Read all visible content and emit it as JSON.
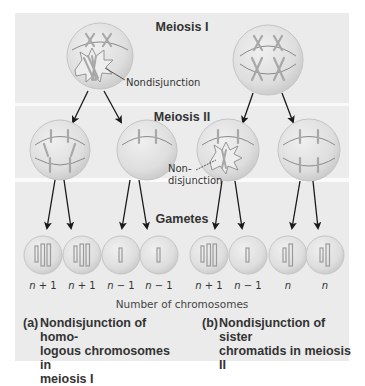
{
  "diagram": {
    "stages": {
      "meiosis_1": "Meiosis I",
      "meiosis_2": "Meiosis II",
      "gametes": "Gametes"
    },
    "callouts": {
      "nondisjunction_a": "Nondisjunction",
      "nondisjunction_b_line1": "Non-",
      "nondisjunction_b_line2": "disjunction"
    },
    "gamete_counts": [
      {
        "n": "n",
        "op": "+ 1",
        "panel": "a"
      },
      {
        "n": "n",
        "op": "+ 1",
        "panel": "a"
      },
      {
        "n": "n",
        "op": "− 1",
        "panel": "a"
      },
      {
        "n": "n",
        "op": "− 1",
        "panel": "a"
      },
      {
        "n": "n",
        "op": "+ 1",
        "panel": "b"
      },
      {
        "n": "n",
        "op": "− 1",
        "panel": "b"
      },
      {
        "n": "n",
        "op": "",
        "panel": "b"
      },
      {
        "n": "n",
        "op": "",
        "panel": "b"
      }
    ],
    "axis_caption": "Number of chromosomes",
    "captions": {
      "a": "(a) Nondisjunction of homo-\nlogous chromosomes in\nmeiosis I",
      "a_label": "(a)",
      "a_lines": [
        "Nondisjunction of homo-",
        "logous chromosomes in",
        "meiosis I"
      ],
      "b_label": "(b)",
      "b_lines": [
        "Nondisjunction of sister",
        "chromatids in meiosis II"
      ]
    },
    "colors": {
      "panel_bg": "#ebebeb",
      "band_divider": "#fafafa",
      "cell_fill": "#dcdcdc",
      "cell_edge": "#c4c4c4",
      "chromosome": "#a8a8a8",
      "spindle": "#8a8a8a",
      "arrow": "#1a1a1a",
      "text": "#333333"
    }
  }
}
